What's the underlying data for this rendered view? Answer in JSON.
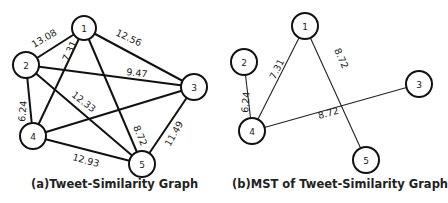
{
  "figure_a": {
    "caption": "(a)Tweet-Similarity Graph",
    "nodes": [
      {
        "id": "1",
        "x": 84,
        "y": 28
      },
      {
        "id": "2",
        "x": 26,
        "y": 65
      },
      {
        "id": "3",
        "x": 194,
        "y": 87
      },
      {
        "id": "4",
        "x": 33,
        "y": 136
      },
      {
        "id": "5",
        "x": 142,
        "y": 164
      }
    ],
    "edges": [
      {
        "from": "1",
        "to": "2",
        "weight": "13.08"
      },
      {
        "from": "1",
        "to": "4",
        "weight": "7.31"
      },
      {
        "from": "1",
        "to": "3",
        "weight": "12.56"
      },
      {
        "from": "1",
        "to": "5",
        "weight": "8.72"
      },
      {
        "from": "2",
        "to": "3",
        "weight": "9.47"
      },
      {
        "from": "2",
        "to": "5",
        "weight": "12.33"
      },
      {
        "from": "2",
        "to": "4",
        "weight": "6.24"
      },
      {
        "from": "3",
        "to": "4",
        "weight": ""
      },
      {
        "from": "3",
        "to": "5",
        "weight": "11.49"
      },
      {
        "from": "4",
        "to": "5",
        "weight": "12.93"
      }
    ]
  },
  "figure_b": {
    "caption": "(b)MST of Tweet-Similarity Graph",
    "nodes": [
      {
        "id": "1",
        "x": 305,
        "y": 26
      },
      {
        "id": "2",
        "x": 244,
        "y": 62
      },
      {
        "id": "3",
        "x": 419,
        "y": 84
      },
      {
        "id": "4",
        "x": 252,
        "y": 131
      },
      {
        "id": "5",
        "x": 366,
        "y": 160
      }
    ],
    "edges": [
      {
        "from": "1",
        "to": "4",
        "weight": "7.31"
      },
      {
        "from": "1",
        "to": "5",
        "weight": "8.72"
      },
      {
        "from": "2",
        "to": "4",
        "weight": "6.24"
      },
      {
        "from": "3",
        "to": "4",
        "weight": "8.72"
      }
    ]
  }
}
